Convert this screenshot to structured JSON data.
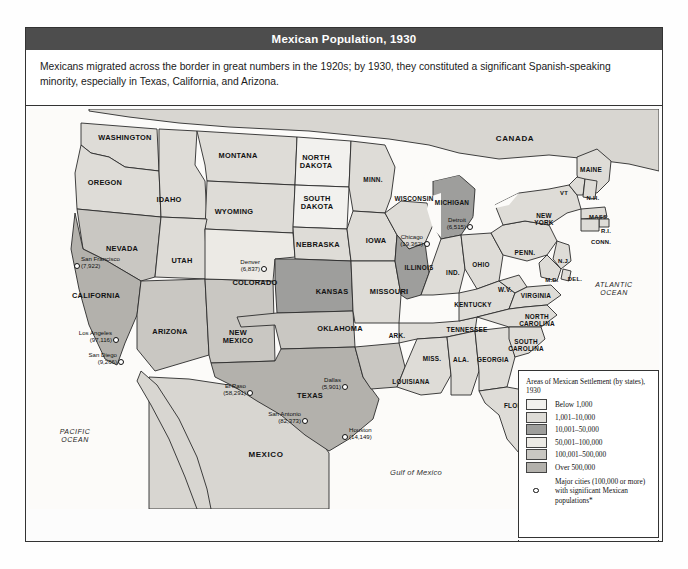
{
  "figure": {
    "title": "Mexican Population, 1930",
    "caption": "Mexicans migrated across the border in great numbers in the 1920s; by 1930, they constituted a significant Spanish-speaking minority, especially in Texas, California, and Arizona."
  },
  "legend": {
    "title": "Areas of Mexican Settlement (by states), 1930",
    "classes": [
      {
        "label": "Below 1,000",
        "color": "#f2f1ee"
      },
      {
        "label": "1,001–10,000",
        "color": "#dedcd7"
      },
      {
        "label": "10,001–50,000",
        "color": "#9e9e9c"
      },
      {
        "label": "50,001–100,000",
        "color": "#eceae5"
      },
      {
        "label": "100,001–500,000",
        "color": "#c9c7c2"
      },
      {
        "label": "Over 500,000",
        "color": "#b3b1ac"
      }
    ],
    "city_marker_label": "Major cities (100,000 or more) with significant Mexican populations*",
    "footnote": "*Population totals include Mexicans born in Mexico and those born in the United States."
  },
  "map": {
    "countries": [
      {
        "name": "CANADA",
        "x": 486,
        "y": 29
      },
      {
        "name": "MEXICO",
        "x": 237,
        "y": 345
      }
    ],
    "oceans": [
      {
        "name": "PACIFIC OCEAN",
        "x": 46,
        "y": 327
      },
      {
        "name": "ATLANTIC OCEAN",
        "x": 585,
        "y": 180
      }
    ],
    "gulf": {
      "name": "Gulf of Mexico",
      "x": 387,
      "y": 363
    },
    "states": [
      {
        "name": "WASHINGTON",
        "x": 96,
        "y": 28,
        "size": ""
      },
      {
        "name": "OREGON",
        "x": 76,
        "y": 73,
        "size": ""
      },
      {
        "name": "IDAHO",
        "x": 140,
        "y": 90,
        "size": ""
      },
      {
        "name": "MONTANA",
        "x": 209,
        "y": 46,
        "size": ""
      },
      {
        "name": "WYOMING",
        "x": 205,
        "y": 102,
        "size": ""
      },
      {
        "name": "NEVADA",
        "x": 93,
        "y": 139,
        "size": ""
      },
      {
        "name": "UTAH",
        "x": 153,
        "y": 151,
        "size": ""
      },
      {
        "name": "CALIFORNIA",
        "x": 67,
        "y": 186,
        "size": ""
      },
      {
        "name": "ARIZONA",
        "x": 141,
        "y": 222,
        "size": ""
      },
      {
        "name": "NEW MEXICO",
        "x": 209,
        "y": 228,
        "size": "",
        "two": true
      },
      {
        "name": "COLORADO",
        "x": 226,
        "y": 173,
        "size": ""
      },
      {
        "name": "NORTH DAKOTA",
        "x": 287,
        "y": 53,
        "size": "",
        "two": true
      },
      {
        "name": "SOUTH DAKOTA",
        "x": 288,
        "y": 94,
        "size": "",
        "two": true
      },
      {
        "name": "NEBRASKA",
        "x": 289,
        "y": 135,
        "size": ""
      },
      {
        "name": "KANSAS",
        "x": 303,
        "y": 182,
        "size": ""
      },
      {
        "name": "OKLAHOMA",
        "x": 311,
        "y": 219,
        "size": ""
      },
      {
        "name": "TEXAS",
        "x": 281,
        "y": 286,
        "size": ""
      },
      {
        "name": "MINN.",
        "x": 344,
        "y": 70,
        "size": "sm"
      },
      {
        "name": "IOWA",
        "x": 347,
        "y": 131,
        "size": ""
      },
      {
        "name": "MISSOURI",
        "x": 360,
        "y": 182,
        "size": ""
      },
      {
        "name": "ARK.",
        "x": 368,
        "y": 226,
        "size": "sm"
      },
      {
        "name": "LOUISIANA",
        "x": 382,
        "y": 272,
        "size": "sm"
      },
      {
        "name": "WISCONSIN",
        "x": 385,
        "y": 89,
        "size": "sm"
      },
      {
        "name": "ILLINOIS",
        "x": 390,
        "y": 158,
        "size": "sm"
      },
      {
        "name": "MICHIGAN",
        "x": 423,
        "y": 93,
        "size": "sm"
      },
      {
        "name": "IND.",
        "x": 424,
        "y": 163,
        "size": "sm"
      },
      {
        "name": "OHIO",
        "x": 452,
        "y": 155,
        "size": "sm"
      },
      {
        "name": "KENTUCKY",
        "x": 444,
        "y": 195,
        "size": "sm"
      },
      {
        "name": "TENNESSEE",
        "x": 438,
        "y": 220,
        "size": "sm"
      },
      {
        "name": "MISS.",
        "x": 403,
        "y": 249,
        "size": "sm"
      },
      {
        "name": "ALA.",
        "x": 432,
        "y": 250,
        "size": "sm"
      },
      {
        "name": "GEORGIA",
        "x": 464,
        "y": 250,
        "size": "sm"
      },
      {
        "name": "FLORIDA",
        "x": 490,
        "y": 296,
        "size": "sm"
      },
      {
        "name": "W.V.",
        "x": 476,
        "y": 180,
        "size": "sm"
      },
      {
        "name": "VIRGINIA",
        "x": 507,
        "y": 186,
        "size": "sm"
      },
      {
        "name": "NORTH CAROLINA",
        "x": 508,
        "y": 211,
        "size": "sm",
        "two": true
      },
      {
        "name": "SOUTH CAROLINA",
        "x": 497,
        "y": 236,
        "size": "sm",
        "two": true
      },
      {
        "name": "PENN.",
        "x": 496,
        "y": 143,
        "size": "sm"
      },
      {
        "name": "NEW YORK",
        "x": 515,
        "y": 110,
        "size": "sm",
        "two": true
      },
      {
        "name": "MAINE",
        "x": 562,
        "y": 60,
        "size": "sm"
      },
      {
        "name": "VT",
        "x": 535,
        "y": 84,
        "size": "xs"
      },
      {
        "name": "N.H.",
        "x": 564,
        "y": 89,
        "size": "xs"
      },
      {
        "name": "MASS.",
        "x": 570,
        "y": 108,
        "size": "xs"
      },
      {
        "name": "R.I.",
        "x": 577,
        "y": 122,
        "size": "xs"
      },
      {
        "name": "CONN.",
        "x": 572,
        "y": 133,
        "size": "xs"
      },
      {
        "name": "N.J.",
        "x": 535,
        "y": 152,
        "size": "xs"
      },
      {
        "name": "M.D.",
        "x": 523,
        "y": 171,
        "size": "xs"
      },
      {
        "name": "DEL.",
        "x": 546,
        "y": 170,
        "size": "xs"
      }
    ],
    "cities": [
      {
        "name": "San Francisco",
        "pop": "(7,922)",
        "dot_x": 48,
        "dot_y": 157,
        "side": "right"
      },
      {
        "name": "Los Angeles",
        "pop": "(97,116)",
        "dot_x": 87,
        "dot_y": 231,
        "side": "left"
      },
      {
        "name": "San Diego",
        "pop": "(9,266)",
        "dot_x": 92,
        "dot_y": 253,
        "side": "left"
      },
      {
        "name": "Denver",
        "pop": "(6,837)",
        "dot_x": 235,
        "dot_y": 160,
        "side": "left"
      },
      {
        "name": "El Paso",
        "pop": "(58,291)",
        "dot_x": 221,
        "dot_y": 284,
        "side": "left"
      },
      {
        "name": "San Antonio",
        "pop": "(82,373)",
        "dot_x": 276,
        "dot_y": 312,
        "side": "left"
      },
      {
        "name": "Houston",
        "pop": "(14,149)",
        "dot_x": 316,
        "dot_y": 328,
        "side": "right"
      },
      {
        "name": "Dallas",
        "pop": "(5,901)",
        "dot_x": 316,
        "dot_y": 278,
        "side": "left"
      },
      {
        "name": "Chicago",
        "pop": "(19,362)",
        "dot_x": 398,
        "dot_y": 135,
        "side": "left"
      },
      {
        "name": "Detroit",
        "pop": "(6,515)",
        "dot_x": 441,
        "dot_y": 118,
        "side": "left"
      }
    ]
  }
}
